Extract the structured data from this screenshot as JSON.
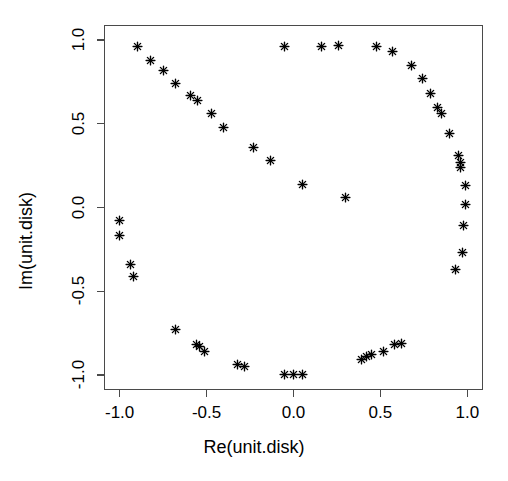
{
  "chart_data": {
    "type": "scatter",
    "title": "",
    "xlabel": "Re(unit.disk)",
    "ylabel": "Im(unit.disk)",
    "xlim": [
      -1.09,
      1.09
    ],
    "ylim": [
      -1.09,
      1.09
    ],
    "grid": false,
    "legend": null,
    "marker": "asterisk-star",
    "marker_color": "#000000",
    "xticks": [
      -1.0,
      -0.5,
      0.0,
      0.5,
      1.0
    ],
    "xticklabels": [
      "-1.0",
      "-0.5",
      "0.0",
      "0.5",
      "1.0"
    ],
    "yticks": [
      -1.0,
      -0.5,
      0.0,
      0.5,
      1.0
    ],
    "yticklabels": [
      "-1.0",
      "-0.5",
      "0.0",
      "0.5",
      "1.0"
    ],
    "series": [
      {
        "name": "unit.disk",
        "points": [
          [
            -0.9,
            0.96
          ],
          [
            -0.82,
            0.88
          ],
          [
            -0.75,
            0.82
          ],
          [
            -0.68,
            0.74
          ],
          [
            -0.59,
            0.67
          ],
          [
            -0.55,
            0.64
          ],
          [
            -0.47,
            0.56
          ],
          [
            -0.4,
            0.48
          ],
          [
            -0.23,
            0.36
          ],
          [
            -0.13,
            0.28
          ],
          [
            0.05,
            0.14
          ],
          [
            0.3,
            0.06
          ],
          [
            -1.0,
            -0.08
          ],
          [
            -1.0,
            -0.17
          ],
          [
            -0.94,
            -0.34
          ],
          [
            -0.92,
            -0.41
          ],
          [
            -0.68,
            -0.73
          ],
          [
            -0.56,
            -0.82
          ],
          [
            -0.54,
            -0.83
          ],
          [
            -0.51,
            -0.86
          ],
          [
            -0.32,
            -0.94
          ],
          [
            -0.28,
            -0.95
          ],
          [
            -0.05,
            -1.0
          ],
          [
            0.0,
            -1.0
          ],
          [
            0.05,
            -1.0
          ],
          [
            0.39,
            -0.91
          ],
          [
            0.42,
            -0.89
          ],
          [
            0.45,
            -0.88
          ],
          [
            0.52,
            -0.86
          ],
          [
            0.58,
            -0.82
          ],
          [
            0.62,
            -0.81
          ],
          [
            0.93,
            -0.37
          ],
          [
            0.97,
            -0.27
          ],
          [
            0.98,
            -0.11
          ],
          [
            0.99,
            0.02
          ],
          [
            0.99,
            0.13
          ],
          [
            0.96,
            0.24
          ],
          [
            0.96,
            0.27
          ],
          [
            0.95,
            0.31
          ],
          [
            0.9,
            0.44
          ],
          [
            0.85,
            0.56
          ],
          [
            0.83,
            0.6
          ],
          [
            0.79,
            0.68
          ],
          [
            0.74,
            0.77
          ],
          [
            0.68,
            0.85
          ],
          [
            0.57,
            0.93
          ],
          [
            0.48,
            0.96
          ],
          [
            0.26,
            0.97
          ],
          [
            0.16,
            0.96
          ],
          [
            -0.05,
            0.96
          ]
        ]
      }
    ]
  },
  "axes": {
    "x_title": "Re(unit.disk)",
    "y_title": "Im(unit.disk)"
  }
}
